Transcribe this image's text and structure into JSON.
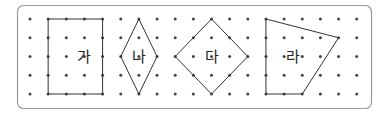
{
  "grid": {
    "cols": 19,
    "rows": 5
  },
  "shapes": [
    {
      "label": "가",
      "name": "shape-ga",
      "points": [
        [
          1,
          0
        ],
        [
          4,
          0
        ],
        [
          4,
          4
        ],
        [
          1,
          4
        ]
      ],
      "label_at": [
        3,
        2
      ]
    },
    {
      "label": "나",
      "name": "shape-na",
      "points": [
        [
          6,
          0
        ],
        [
          7,
          2
        ],
        [
          6,
          4
        ],
        [
          5,
          2
        ]
      ],
      "label_at": [
        6,
        2
      ]
    },
    {
      "label": "다",
      "name": "shape-da",
      "points": [
        [
          10,
          0
        ],
        [
          12,
          2
        ],
        [
          10,
          4
        ],
        [
          8,
          2
        ]
      ],
      "label_at": [
        10,
        2
      ]
    },
    {
      "label": "라",
      "name": "shape-ra",
      "points": [
        [
          13,
          0
        ],
        [
          17,
          1
        ],
        [
          15,
          4
        ],
        [
          13,
          4
        ]
      ],
      "label_at": [
        14.5,
        2
      ]
    }
  ],
  "colors": {
    "frame": "#9a9a9a",
    "dot": "#444444",
    "line": "#333333"
  }
}
